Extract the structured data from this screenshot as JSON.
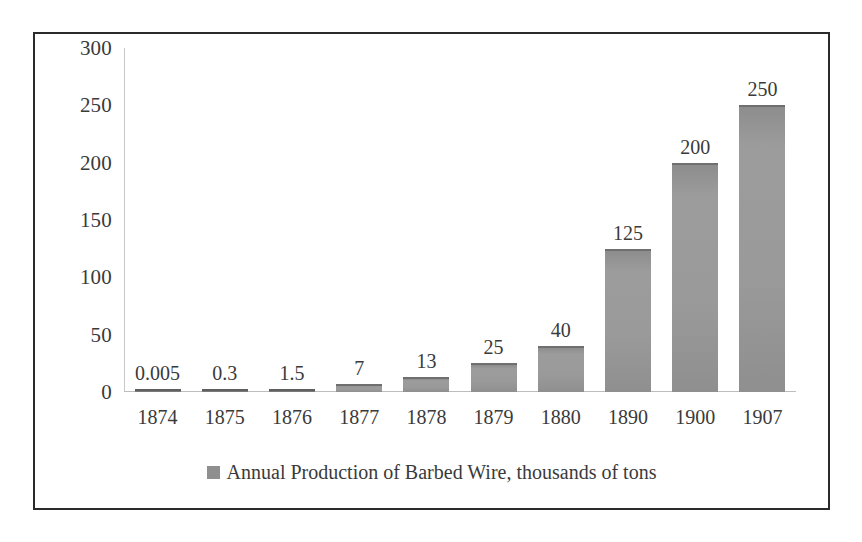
{
  "chart_data": {
    "type": "bar",
    "title": "",
    "xlabel": "",
    "ylabel": "",
    "categories": [
      "1874",
      "1875",
      "1876",
      "1877",
      "1878",
      "1879",
      "1880",
      "1890",
      "1900",
      "1907"
    ],
    "values": [
      0.005,
      0.3,
      1.5,
      7,
      13,
      25,
      40,
      125,
      200,
      250
    ],
    "value_labels": [
      "0.005",
      "0.3",
      "1.5",
      "7",
      "13",
      "25",
      "40",
      "125",
      "200",
      "250"
    ],
    "series": [
      {
        "name": "Annual Production of Barbed Wire, thousands of tons",
        "values": [
          0.005,
          0.3,
          1.5,
          7,
          13,
          25,
          40,
          125,
          200,
          250
        ],
        "color": "#8f8f8f"
      }
    ],
    "ylim": [
      0,
      300
    ],
    "y_ticks": [
      0,
      50,
      100,
      150,
      200,
      250,
      300
    ],
    "y_tick_labels": [
      "0",
      "50",
      "100",
      "150",
      "200",
      "250",
      "300"
    ],
    "grid": false,
    "legend": {
      "position": "bottom",
      "entries": [
        {
          "label": "Annual Production of Barbed Wire, thousands of tons",
          "swatch_name": "legend-color-swatch",
          "color": "#8f8f8f"
        }
      ]
    },
    "colors": {
      "bar_fill": "#9a9a9a",
      "bar_top_edge": "#6f6f6f",
      "axis_line": "#c9c9c9",
      "border": "#2b2b2b",
      "text": "#3a3a3a",
      "background": "#ffffff"
    }
  }
}
